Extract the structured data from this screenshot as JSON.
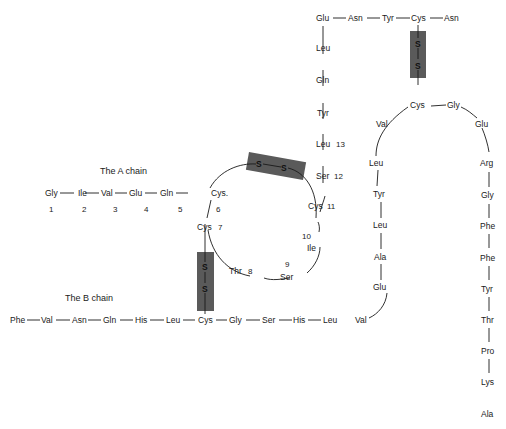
{
  "diagram": {
    "labels": {
      "a_chain": "The A chain",
      "b_chain": "The B chain"
    },
    "a_chain": {
      "residues": [
        {
          "name": "Gly",
          "num": "1"
        },
        {
          "name": "Ile",
          "num": "2"
        },
        {
          "name": "Val",
          "num": "3"
        },
        {
          "name": "Glu",
          "num": "4"
        },
        {
          "name": "Gln",
          "num": "5"
        },
        {
          "name": "Cys.",
          "num": "6"
        },
        {
          "name": "Cys",
          "num": "7"
        },
        {
          "name": "Thr",
          "num": "8"
        },
        {
          "name": "Ser",
          "num": "9"
        },
        {
          "name": "Ile",
          "num": "10"
        },
        {
          "name": "Cys",
          "num": "11"
        },
        {
          "name": "Ser",
          "num": "12"
        },
        {
          "name": "Leu",
          "num": "13"
        },
        {
          "name": "Tyr",
          "num": ""
        },
        {
          "name": "Gln",
          "num": ""
        },
        {
          "name": "Leu",
          "num": ""
        },
        {
          "name": "Glu",
          "num": ""
        },
        {
          "name": "Asn",
          "num": ""
        },
        {
          "name": "Tyr",
          "num": ""
        },
        {
          "name": "Cys",
          "num": ""
        },
        {
          "name": "Asn",
          "num": ""
        }
      ]
    },
    "b_chain": {
      "residues": [
        "Phe",
        "Val",
        "Asn",
        "Gln",
        "His",
        "Leu",
        "Cys",
        "Gly",
        "Ser",
        "His",
        "Leu",
        "Val",
        "Glu",
        "Ala",
        "Leu",
        "Tyr",
        "Leu",
        "Val",
        "Cys",
        "Gly",
        "Glu",
        "Arg",
        "Gly",
        "Phe",
        "Phe",
        "Tyr",
        "Thr",
        "Pro",
        "Lys",
        "Ala"
      ]
    },
    "disulfide_bonds": [
      {
        "label": "S—S",
        "atoms": [
          "S",
          "S"
        ],
        "between": "A6-A11"
      },
      {
        "label": "S—S",
        "atoms": [
          "S",
          "S"
        ],
        "between": "A7-B7"
      },
      {
        "label": "S—S",
        "atoms": [
          "S",
          "S"
        ],
        "between": "A20-B19"
      }
    ],
    "colors": {
      "bond_box": "#5a5a5a",
      "text": "#1a1a1a",
      "background": "#ffffff"
    }
  }
}
